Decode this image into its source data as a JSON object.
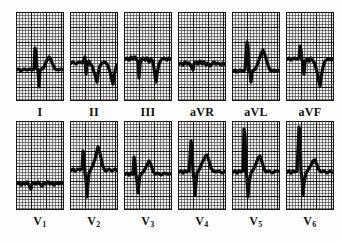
{
  "figure": {
    "type": "ecg-12-lead-grid",
    "rows": 2,
    "columns": 6,
    "paper": {
      "background_color": "#f2f0ec",
      "minor_grid_color": "#282624",
      "major_grid_color": "#181614",
      "trace_color": "#0b0a09",
      "minor_grid_px": 3,
      "major_grid_px": 15,
      "panel_width_px": 48,
      "panel_height_px": 89
    }
  },
  "rows": [
    {
      "name": "limb-leads",
      "leads": [
        {
          "id": "I",
          "label": "I",
          "subscript": "",
          "baseline_pct": 58,
          "morphology": "small R spike, deep narrow S, broad upright T",
          "path": "M0,58 L3,57 L5,59 L8,57 L11,58 L14,57 L16,58 L18,57 L19,36 L20,40 L21,57 L22,58 L23,75 L24,58 L26,57 L28,55 L31,48 L33,45 L35,48 L37,53 L39,57 L42,58 L45,57 L48,58"
        },
        {
          "id": "II",
          "label": "II",
          "subscript": "",
          "baseline_pct": 50,
          "morphology": "notched QRS, deep inverted T waves, two complexes",
          "path": "M0,52 L3,50 L6,52 L9,50 L12,51 L14,48 L15,45 L16,62 L17,50 L18,52 L19,49 L20,52 L22,54 L24,60 L26,66 L27,70 L28,62 L30,54 L32,51 L34,50 L36,51 L38,54 L40,60 L42,68 L43,72 L44,64 L46,55 L48,52"
        },
        {
          "id": "III",
          "label": "III",
          "subscript": "",
          "baseline_pct": 46,
          "morphology": "low amplitude QRS with deep S, deep inverted T",
          "path": "M0,48 L3,46 L5,48 L7,45 L9,47 L11,45 L13,48 L14,50 L15,66 L16,52 L17,48 L19,46 L21,48 L23,46 L25,50 L27,47 L29,50 L30,56 L31,64 L32,70 L33,62 L35,52 L37,48 L40,46 L43,48 L45,46 L48,48"
        },
        {
          "id": "aVR",
          "label": "aVR",
          "subscript": "",
          "baseline_pct": 52,
          "morphology": "low amplitude, slightly negative complexes",
          "path": "M0,53 L3,51 L5,53 L7,50 L9,52 L11,51 L13,54 L15,58 L16,52 L18,50 L20,52 L22,49 L24,52 L26,50 L28,53 L30,51 L32,54 L34,52 L36,50 L38,52 L40,51 L43,53 L45,51 L48,53"
        },
        {
          "id": "aVL",
          "label": "aVL",
          "subscript": "",
          "baseline_pct": 58,
          "morphology": "tall narrow R spike, peaked upright T wave",
          "path": "M0,60 L3,58 L5,60 L8,58 L11,59 L13,58 L15,30 L16,34 L17,58 L18,60 L19,70 L20,60 L22,58 L24,56 L27,48 L29,42 L31,38 L33,43 L35,50 L37,56 L39,59 L42,58 L45,59 L48,58"
        },
        {
          "id": "aVF",
          "label": "aVF",
          "subscript": "",
          "baseline_pct": 46,
          "morphology": "R spike then deep S, deep inverted T",
          "path": "M0,48 L3,46 L5,48 L8,46 L11,47 L13,46 L14,34 L15,38 L16,48 L17,50 L18,62 L19,50 L21,47 L23,49 L25,46 L27,49 L29,52 L31,60 L33,70 L34,74 L35,66 L37,55 L39,49 L42,47 L45,48 L48,47"
        }
      ]
    },
    {
      "name": "chest-leads",
      "leads": [
        {
          "id": "V1",
          "label": "V",
          "subscript": "1",
          "baseline_pct": 62,
          "morphology": "near isoelectric, very low amplitude rS complexes",
          "path": "M0,63 L3,62 L5,64 L7,62 L9,63 L11,61 L13,64 L15,68 L16,63 L18,62 L20,63 L22,61 L24,63 L26,65 L28,62 L30,63 L32,61 L34,63 L36,62 L38,64 L40,62 L43,63 L45,62 L48,63"
        },
        {
          "id": "V2",
          "label": "V",
          "subscript": "2",
          "baseline_pct": 48,
          "morphology": "tall R spike, very deep S, tall peaked T wave",
          "path": "M0,50 L3,48 L5,50 L8,48 L10,49 L12,48 L13,30 L14,36 L15,52 L16,60 L17,76 L18,62 L19,52 L21,48 L23,44 L25,38 L27,30 L28,26 L30,32 L32,42 L34,48 L36,50 L39,48 L42,50 L45,48 L48,50"
        },
        {
          "id": "V3",
          "label": "V",
          "subscript": "3",
          "baseline_pct": 52,
          "morphology": "R spike, deep S, broad peaked T wave",
          "path": "M0,54 L3,52 L5,54 L7,52 L9,53 L10,36 L11,42 L12,54 L13,60 L14,72 L15,62 L16,54 L18,52 L20,50 L23,44 L25,40 L27,44 L29,50 L31,53 L34,52 L37,54 L40,52 L44,53 L48,52"
        },
        {
          "id": "V4",
          "label": "V",
          "subscript": "4",
          "baseline_pct": 50,
          "morphology": "very tall R spike, deep S, broad peaked T wave",
          "path": "M0,52 L3,50 L5,52 L7,50 L9,51 L11,50 L13,20 L14,26 L15,50 L16,58 L17,74 L18,62 L19,52 L21,49 L24,42 L27,36 L29,34 L31,40 L33,47 L35,50 L38,51 L41,50 L44,52 L48,50"
        },
        {
          "id": "V5",
          "label": "V",
          "subscript": "5",
          "baseline_pct": 50,
          "morphology": "very tall R spike reaching top of panel, deep S, peaked T",
          "path": "M0,52 L3,50 L5,52 L7,50 L9,51 L11,50 L12,8 L13,14 L14,50 L15,58 L16,76 L17,62 L19,52 L21,49 L24,43 L26,37 L28,35 L30,41 L32,48 L34,51 L37,50 L40,52 L44,50 L48,51"
        },
        {
          "id": "V6",
          "label": "V",
          "subscript": "6",
          "baseline_pct": 50,
          "morphology": "tall R spike reaching top of panel, deep S, rounded T",
          "path": "M0,52 L3,50 L5,52 L7,50 L9,51 L11,50 L13,6 L14,12 L15,50 L16,58 L17,74 L18,62 L20,52 L22,49 L25,44 L27,40 L29,39 L31,44 L33,49 L35,51 L38,50 L41,52 L44,50 L48,52"
        }
      ]
    }
  ]
}
